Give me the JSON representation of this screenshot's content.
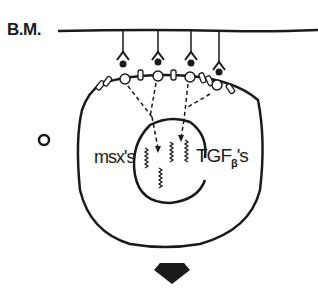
{
  "labels": {
    "basement_membrane": "B.M.",
    "msx": "msx's",
    "tgf_main": "TGF",
    "tgf_sub": "β",
    "tgf_suffix": "'s"
  },
  "colors": {
    "ink": "#1a1a1a",
    "background": "#ffffff"
  },
  "elements": {
    "receptors_count": 4,
    "genes_count": 4
  }
}
